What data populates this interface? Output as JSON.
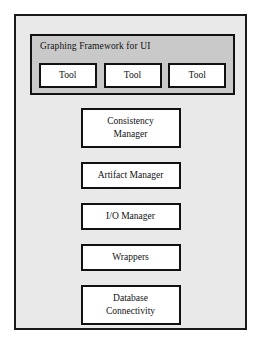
{
  "diagram": {
    "type": "layered-architecture-block-diagram",
    "colors": {
      "page_background": "#ffffff",
      "container_fill": "#e9e9e9",
      "framework_panel_fill": "#c9c9c9",
      "box_fill": "#ffffff",
      "border": "#111111",
      "text": "#111111"
    },
    "framework": {
      "title": "Graphing Framework for UI",
      "tools": [
        {
          "label": "Tool"
        },
        {
          "label": "Tool"
        },
        {
          "label": "Tool"
        }
      ]
    },
    "components": [
      {
        "lines": [
          "Consistency",
          "Manager"
        ]
      },
      {
        "lines": [
          "Artifact Manager"
        ]
      },
      {
        "lines": [
          "I/O Manager"
        ]
      },
      {
        "lines": [
          "Wrappers"
        ]
      },
      {
        "lines": [
          "Database",
          "Connectivity"
        ]
      }
    ]
  }
}
